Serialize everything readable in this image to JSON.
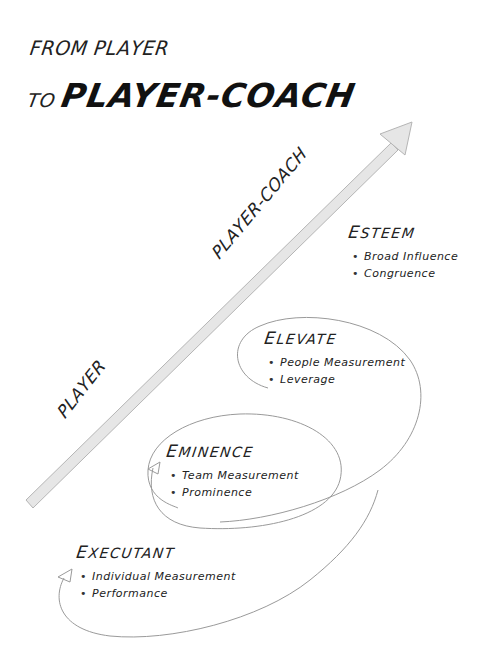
{
  "title": {
    "line1": "FROM PLAYER",
    "line2_prefix": "TO",
    "line2_main": "PLAYER-COACH"
  },
  "axis": {
    "low_label": "PLAYER",
    "high_label": "PLAYER-COACH",
    "arrow_color": "#e4e4e4",
    "arrow_stroke": "#b8b8b8"
  },
  "stages": [
    {
      "id": "executant",
      "title_first": "E",
      "title_rest": "XECUTANT",
      "bullets": [
        "Individual Measurement",
        "Performance"
      ]
    },
    {
      "id": "eminence",
      "title_first": "E",
      "title_rest": "MINENCE",
      "bullets": [
        "Team Measurement",
        "Prominence"
      ]
    },
    {
      "id": "elevate",
      "title_first": "E",
      "title_rest": "LEVATE",
      "bullets": [
        "People Measurement",
        "Leverage"
      ]
    },
    {
      "id": "esteem",
      "title_first": "E",
      "title_rest": "STEEM",
      "bullets": [
        "Broad Influence",
        "Congruence"
      ]
    }
  ],
  "colors": {
    "ink": "#1a1a1a",
    "loop_line": "#9a9a9a",
    "background": "#ffffff"
  }
}
